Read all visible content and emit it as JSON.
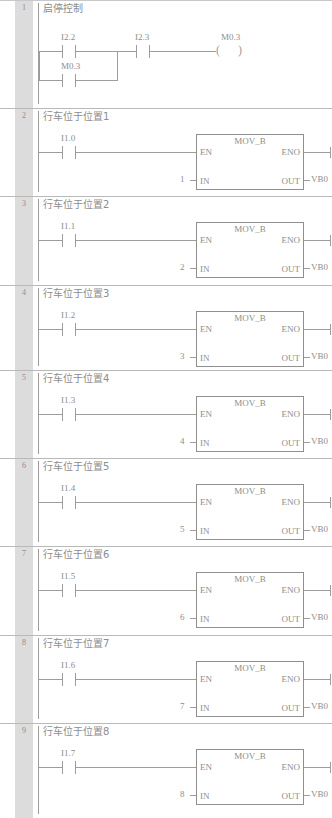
{
  "document": {
    "type": "plc-ladder-diagram",
    "language": "LAD",
    "block_name": "MOV_B"
  },
  "style": {
    "line_color": "#9d9d9d",
    "gutter_color": "#dcdcdc",
    "text_color": "#8d8d8d",
    "background": "#ffffff"
  },
  "networks": [
    {
      "number": "1",
      "title": "启停控制",
      "type": "latch",
      "contacts": [
        {
          "address": "I2.2",
          "kind": "normally-open",
          "branch": "top"
        },
        {
          "address": "M0.3",
          "kind": "normally-open",
          "branch": "bottom"
        },
        {
          "address": "I2.3",
          "kind": "normally-open",
          "branch": "series"
        }
      ],
      "coil": {
        "address": "M0.3",
        "kind": "output-coil"
      }
    },
    {
      "number": "2",
      "title": "行车位于位置1",
      "type": "move",
      "contact": {
        "address": "I1.0",
        "kind": "normally-open"
      },
      "block": {
        "name": "MOV_B",
        "pin_en": "EN",
        "pin_eno": "ENO",
        "pin_in": "IN",
        "pin_out": "OUT",
        "in_value": "1",
        "out_value": "VB0"
      }
    },
    {
      "number": "3",
      "title": "行车位于位置2",
      "type": "move",
      "contact": {
        "address": "I1.1",
        "kind": "normally-open"
      },
      "block": {
        "name": "MOV_B",
        "pin_en": "EN",
        "pin_eno": "ENO",
        "pin_in": "IN",
        "pin_out": "OUT",
        "in_value": "2",
        "out_value": "VB0"
      }
    },
    {
      "number": "4",
      "title": "行车位于位置3",
      "type": "move",
      "contact": {
        "address": "I1.2",
        "kind": "normally-open"
      },
      "block": {
        "name": "MOV_B",
        "pin_en": "EN",
        "pin_eno": "ENO",
        "pin_in": "IN",
        "pin_out": "OUT",
        "in_value": "3",
        "out_value": "VB0"
      }
    },
    {
      "number": "5",
      "title": "行车位于位置4",
      "type": "move",
      "contact": {
        "address": "I1.3",
        "kind": "normally-open"
      },
      "block": {
        "name": "MOV_B",
        "pin_en": "EN",
        "pin_eno": "ENO",
        "pin_in": "IN",
        "pin_out": "OUT",
        "in_value": "4",
        "out_value": "VB0"
      }
    },
    {
      "number": "6",
      "title": "行车位于位置5",
      "type": "move",
      "contact": {
        "address": "I1.4",
        "kind": "normally-open"
      },
      "block": {
        "name": "MOV_B",
        "pin_en": "EN",
        "pin_eno": "ENO",
        "pin_in": "IN",
        "pin_out": "OUT",
        "in_value": "5",
        "out_value": "VB0"
      }
    },
    {
      "number": "7",
      "title": "行车位于位置6",
      "type": "move",
      "contact": {
        "address": "I1.5",
        "kind": "normally-open"
      },
      "block": {
        "name": "MOV_B",
        "pin_en": "EN",
        "pin_eno": "ENO",
        "pin_in": "IN",
        "pin_out": "OUT",
        "in_value": "6",
        "out_value": "VB0"
      }
    },
    {
      "number": "8",
      "title": "行车位于位置7",
      "type": "move",
      "contact": {
        "address": "I1.6",
        "kind": "normally-open"
      },
      "block": {
        "name": "MOV_B",
        "pin_en": "EN",
        "pin_eno": "ENO",
        "pin_in": "IN",
        "pin_out": "OUT",
        "in_value": "7",
        "out_value": "VB0"
      }
    },
    {
      "number": "9",
      "title": "行车位于位置8",
      "type": "move",
      "contact": {
        "address": "I1.7",
        "kind": "normally-open"
      },
      "block": {
        "name": "MOV_B",
        "pin_en": "EN",
        "pin_eno": "ENO",
        "pin_in": "IN",
        "pin_out": "OUT",
        "in_value": "8",
        "out_value": "VB0"
      }
    }
  ]
}
